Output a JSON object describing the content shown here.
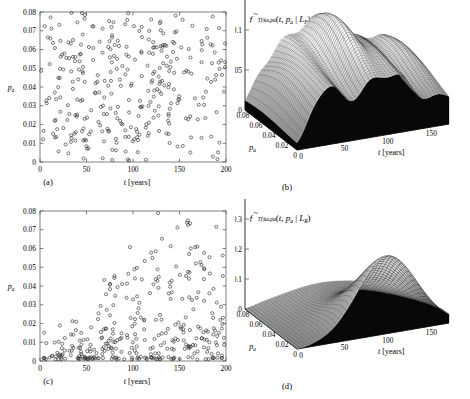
{
  "figure": {
    "background": "#ffffff",
    "marker_color": "#2a2a2a",
    "mesh_color": "#202020",
    "skirt_color": "#080808"
  },
  "panels": [
    {
      "id": "a",
      "label": "(a)",
      "type": "scatter",
      "xlabel_italic": "t",
      "xlabel_rest": " [years]",
      "ylabel_main": "p",
      "ylabel_sub": "a",
      "xticks": [
        "0",
        "50",
        "100",
        "150",
        "200"
      ],
      "xtick_values": [
        0,
        50,
        100,
        150,
        200
      ],
      "yticks": [
        "0",
        "0.01",
        "0.02",
        "0.03",
        "0.04",
        "0.05",
        "0.06",
        "0.07",
        "0.08"
      ],
      "ytick_values": [
        0,
        0.01,
        0.02,
        0.03,
        0.04,
        0.05,
        0.06,
        0.07,
        0.08
      ],
      "xlim": [
        0,
        200
      ],
      "ylim": [
        0,
        0.08
      ],
      "n_points": 330,
      "distribution": "uniform-scatter-full-range"
    },
    {
      "id": "c",
      "label": "(c)",
      "type": "scatter",
      "xlabel_italic": "t",
      "xlabel_rest": " [years]",
      "ylabel_main": "p",
      "ylabel_sub": "a",
      "xticks": [
        "0",
        "50",
        "100",
        "150",
        "200"
      ],
      "xtick_values": [
        0,
        50,
        100,
        150,
        200
      ],
      "yticks": [
        "0",
        "0.01",
        "0.02",
        "0.03",
        "0.04",
        "0.05",
        "0.06",
        "0.07",
        "0.08"
      ],
      "ytick_values": [
        0,
        0.01,
        0.02,
        0.03,
        0.04,
        0.05,
        0.06,
        0.07,
        0.08
      ],
      "xlim": [
        0,
        200
      ],
      "ylim": [
        0,
        0.08
      ],
      "n_points": 330,
      "distribution": "low-pa-concentrated-fanning"
    },
    {
      "id": "b",
      "label": "(b)",
      "type": "surface",
      "title_parts": {
        "f": "f",
        "f_sub": "T",
        "f_sub2": "f",
        "cond": "|k",
        "cond_sub": "a",
        "cond2": ",p",
        "cond2_sub": "a",
        "args": "(t, p",
        "args_sub": "a",
        "args_end": " | L",
        "args_end_sub": "F",
        "close": ")"
      },
      "title_plain": "f~_{T_f|k_a,p_a}( t , p_a | L_F )",
      "zticks": [
        "0",
        "0.05",
        "0.1",
        "0.15"
      ],
      "ztick_values": [
        0,
        0.05,
        0.1,
        0.15
      ],
      "zlim": [
        0,
        0.15
      ],
      "paticks": [
        "0.08",
        "0.06",
        "0.04",
        "0.02",
        "0"
      ],
      "patick_values": [
        0.08,
        0.06,
        0.04,
        0.02,
        0
      ],
      "tticks": [
        "0",
        "50",
        "100",
        "150"
      ],
      "ttick_values": [
        0,
        50,
        100,
        150
      ],
      "xlabel_italic": "t",
      "xlabel_rest": " [years]",
      "palabel_main": "p",
      "palabel_sub": "a",
      "surface_shape": "broad-ridged-plateau",
      "peak_value": 0.115
    },
    {
      "id": "d",
      "label": "(d)",
      "type": "surface",
      "title_parts": {
        "f": "f",
        "f_sub": "T",
        "f_sub2": "f",
        "cond": "|k",
        "cond_sub": "a",
        "cond2": ",p",
        "cond2_sub": "a",
        "args": "(t, p",
        "args_sub": "a",
        "args_end": " | L",
        "args_end_sub": "R",
        "close": ")"
      },
      "title_plain": "f~_{T_f|k_a,p_a}( t , p_a | L_R )",
      "zticks": [
        "0",
        "0.1",
        "0.2",
        "0.3",
        "0.4"
      ],
      "ztick_values": [
        0,
        0.1,
        0.2,
        0.3,
        0.4
      ],
      "zlim": [
        0,
        0.4
      ],
      "paticks": [
        "0.08",
        "0.06",
        "0.04",
        "0.02",
        "0"
      ],
      "patick_values": [
        0.08,
        0.06,
        0.04,
        0.02,
        0
      ],
      "tticks": [
        "0",
        "50",
        "100",
        "150"
      ],
      "ttick_values": [
        0,
        50,
        100,
        150
      ],
      "xlabel_italic": "t",
      "xlabel_rest": " [years]",
      "palabel_main": "p",
      "palabel_sub": "a",
      "surface_shape": "single-peak-ridge",
      "peak_value": 0.23
    }
  ],
  "chart_data": [
    {
      "type": "scatter",
      "panel": "a",
      "title": "",
      "xlabel": "t [years]",
      "ylabel": "p_a",
      "xlim": [
        0,
        200
      ],
      "ylim": [
        0,
        0.08
      ],
      "grid": false,
      "legend": "none",
      "description": "Samples of (t, p_a) spread fairly uniformly across the full domain, slight thinning at high t.",
      "n_points": 330
    },
    {
      "type": "scatter",
      "panel": "c",
      "title": "",
      "xlabel": "t [years]",
      "ylabel": "p_a",
      "xlim": [
        0,
        200
      ],
      "ylim": [
        0,
        0.08
      ],
      "grid": false,
      "legend": "none",
      "description": "Samples concentrated at low p_a for small t, fanning upward as t increases.",
      "n_points": 330
    },
    {
      "type": "surface",
      "panel": "b",
      "title": "f~_{T_f|k_a,p_a}(t, p_a | L_F)",
      "xlabel": "t [years]",
      "ylabel": "p_a",
      "zlabel": "",
      "xlim": [
        0,
        175
      ],
      "ylim": [
        0,
        0.08
      ],
      "zlim": [
        0,
        0.15
      ],
      "grid": true,
      "legend": "none",
      "description": "Broad plateau surface, ridged along t, height roughly 0.05-0.115, decaying toward large t."
    },
    {
      "type": "surface",
      "panel": "d",
      "title": "f~_{T_f|k_a,p_a}(t, p_a | L_R)",
      "xlabel": "t [years]",
      "ylabel": "p_a",
      "zlabel": "",
      "xlim": [
        0,
        175
      ],
      "ylim": [
        0,
        0.08
      ],
      "zlim": [
        0,
        0.4
      ],
      "grid": true,
      "legend": "none",
      "description": "Single pronounced peak near t=100-110 at low p_a, peak height about 0.23, flat elsewhere."
    }
  ]
}
